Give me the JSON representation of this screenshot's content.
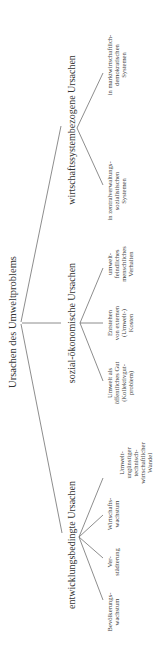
{
  "diagram": {
    "type": "tree",
    "orientation": "rotated-90-ccw",
    "root": {
      "label": "Ursachen des Umweltproblems"
    },
    "branches": [
      {
        "label": "wirtschaftssystembezogene Ursachen",
        "children": [
          {
            "lines": [
              "in zentralverwaltungs-",
              "sozialistischen",
              "Systemen"
            ]
          },
          {
            "lines": [
              "in marktwirtschaftlich-",
              "demokratischen",
              "Systemen"
            ]
          }
        ]
      },
      {
        "label": "sozial-ökonomische Ursachen",
        "children": [
          {
            "lines": [
              "Umwelt als",
              "öffentliches Gut",
              "(Kollektivgut-",
              "problem)"
            ]
          },
          {
            "lines": [
              "Entstehen",
              "von externen",
              "(Umwelt-)",
              "Kosten"
            ]
          },
          {
            "lines": [
              "umwelt-",
              "feindliches",
              "menschliches",
              "Verhalten"
            ]
          }
        ]
      },
      {
        "label": "entwicklungsbedingte Ursachen",
        "children": [
          {
            "lines": [
              "Bevölkerungs-",
              "wachstum"
            ]
          },
          {
            "lines": [
              "Ver-",
              "städterung"
            ]
          },
          {
            "lines": [
              "Wirtschafts-",
              "wachstum"
            ]
          },
          {
            "lines": [
              "Umwelt-",
              "ungünstiger",
              "technisch-",
              "wirtschaftlicher",
              "Wandel"
            ]
          }
        ]
      }
    ]
  }
}
